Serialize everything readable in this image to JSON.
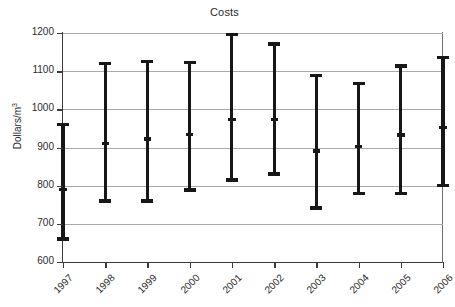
{
  "chart_data": {
    "type": "bar",
    "title": "Costs",
    "xlabel": "",
    "ylabel": "Dollars/m",
    "ylabel_superscript": "3",
    "ylabel_full": "Dollars/m3",
    "categories": [
      "1997",
      "1998",
      "1999",
      "2000",
      "2001",
      "2002",
      "2003",
      "2004",
      "2005",
      "2006"
    ],
    "ylim": [
      600,
      1200
    ],
    "ytick_labels": [
      "600",
      "700",
      "800",
      "900",
      "1000",
      "1100",
      "1200"
    ],
    "ytick_values": [
      600,
      700,
      800,
      900,
      1000,
      1100,
      1200
    ],
    "grid": true,
    "legend": "none",
    "series": [
      {
        "name": "high",
        "values": [
          960,
          1120,
          1126,
          1123,
          1196,
          1171,
          1088,
          1068,
          1114,
          1136
        ]
      },
      {
        "name": "mid",
        "values": [
          790,
          911,
          922,
          934,
          974,
          973,
          891,
          902,
          933,
          953
        ]
      },
      {
        "name": "low",
        "values": [
          660,
          760,
          760,
          789,
          815,
          831,
          741,
          780,
          779,
          800
        ]
      }
    ],
    "points": [
      {
        "category": "1997",
        "low": 660,
        "mid": 790,
        "high": 960
      },
      {
        "category": "1998",
        "low": 760,
        "mid": 911,
        "high": 1120
      },
      {
        "category": "1999",
        "low": 760,
        "mid": 922,
        "high": 1126
      },
      {
        "category": "2000",
        "low": 789,
        "mid": 934,
        "high": 1123
      },
      {
        "category": "2001",
        "low": 815,
        "mid": 974,
        "high": 1196
      },
      {
        "category": "2002",
        "low": 831,
        "mid": 973,
        "high": 1171
      },
      {
        "category": "2003",
        "low": 741,
        "mid": 891,
        "high": 1088
      },
      {
        "category": "2004",
        "low": 780,
        "mid": 902,
        "high": 1068
      },
      {
        "category": "2005",
        "low": 779,
        "mid": 933,
        "high": 1114
      },
      {
        "category": "2006",
        "low": 800,
        "mid": 953,
        "high": 1136
      }
    ],
    "colors": {
      "series": "#171717",
      "grid": "#a9a9a9",
      "axis": "#3a3a3a",
      "text": "#2b2b2b",
      "background": "#ffffff"
    }
  }
}
